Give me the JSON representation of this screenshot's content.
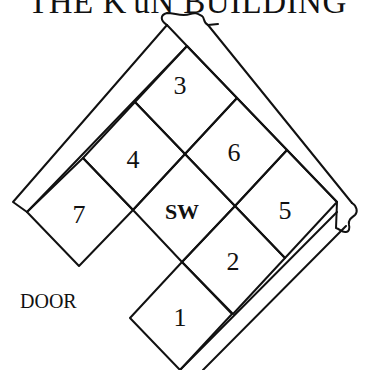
{
  "title": "THE K'uN BUILDING",
  "door_label": "DOOR",
  "cells": [
    {
      "id": "3",
      "label": "3"
    },
    {
      "id": "4",
      "label": "4"
    },
    {
      "id": "6",
      "label": "6"
    },
    {
      "id": "7",
      "label": "7"
    },
    {
      "id": "sw",
      "label": "SW"
    },
    {
      "id": "5",
      "label": "5"
    },
    {
      "id": "2",
      "label": "2"
    },
    {
      "id": "1",
      "label": "1"
    }
  ]
}
